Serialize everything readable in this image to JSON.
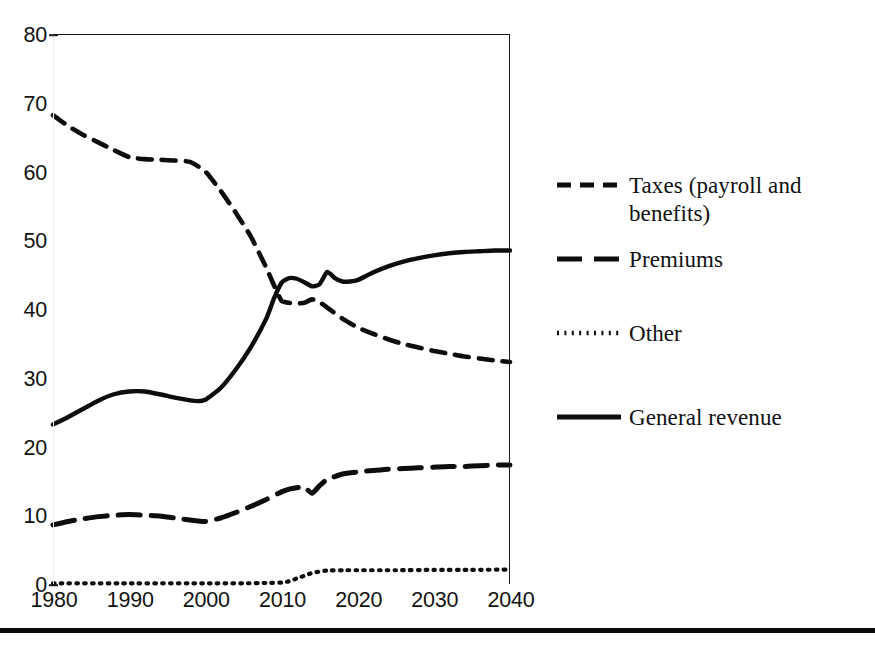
{
  "chart_data": {
    "type": "line",
    "title": "",
    "subtitle": "",
    "xlabel": "",
    "ylabel": "",
    "xlim": [
      1980,
      2040
    ],
    "ylim": [
      0,
      80
    ],
    "ytick_labels": [
      "0",
      "10",
      "20",
      "30",
      "40",
      "50",
      "60",
      "70",
      "80"
    ],
    "ytick_values": [
      0,
      10,
      20,
      30,
      40,
      50,
      60,
      70,
      80
    ],
    "xtick_labels": [
      "1980",
      "1990",
      "2000",
      "2010",
      "2020",
      "2030",
      "2040"
    ],
    "xtick_values": [
      1980,
      1990,
      2000,
      2010,
      2020,
      2030,
      2040
    ],
    "grid": false,
    "legend_position": "right",
    "series": [
      {
        "name": "Taxes (payroll and benefits)",
        "style": "dashed",
        "color": "#0d0d0d",
        "x": [
          1980,
          1982,
          1984,
          1986,
          1988,
          1990,
          1992,
          1994,
          1996,
          1998,
          2000,
          2002,
          2004,
          2006,
          2008,
          2009,
          2010,
          2011,
          2012,
          2013,
          2014,
          2015,
          2016,
          2018,
          2020,
          2022,
          2024,
          2026,
          2028,
          2030,
          2032,
          2034,
          2036,
          2038,
          2040
        ],
        "values": [
          68.2,
          66.6,
          65.3,
          64.2,
          63.1,
          62.1,
          61.8,
          61.7,
          61.6,
          61.4,
          60.0,
          57.2,
          54.0,
          50.5,
          46.0,
          43.5,
          41.2,
          40.9,
          40.8,
          40.9,
          41.4,
          41.0,
          40.2,
          38.6,
          37.3,
          36.4,
          35.6,
          34.9,
          34.4,
          33.9,
          33.5,
          33.1,
          32.8,
          32.5,
          32.3
        ]
      },
      {
        "name": "Premiums",
        "style": "long-dashed",
        "color": "#0d0d0d",
        "x": [
          1980,
          1982,
          1984,
          1986,
          1988,
          1990,
          1992,
          1994,
          1996,
          1998,
          2000,
          2002,
          2004,
          2006,
          2008,
          2010,
          2011,
          2012,
          2013,
          2014,
          2015,
          2016,
          2018,
          2020,
          2022,
          2024,
          2026,
          2028,
          2030,
          2032,
          2034,
          2036,
          2038,
          2040
        ],
        "values": [
          8.6,
          9.1,
          9.5,
          9.8,
          10.0,
          10.1,
          10.0,
          9.9,
          9.6,
          9.3,
          9.1,
          9.6,
          10.4,
          11.3,
          12.3,
          13.4,
          13.8,
          14.0,
          14.1,
          13.2,
          14.3,
          15.2,
          16.0,
          16.3,
          16.5,
          16.7,
          16.8,
          16.9,
          17.0,
          17.1,
          17.1,
          17.2,
          17.3,
          17.3
        ]
      },
      {
        "name": "Other",
        "style": "dotted",
        "color": "#0d0d0d",
        "x": [
          1980,
          1990,
          2000,
          2005,
          2008,
          2010,
          2011,
          2012,
          2013,
          2014,
          2015,
          2016,
          2018,
          2020,
          2025,
          2030,
          2035,
          2040
        ],
        "values": [
          0.1,
          0.1,
          0.1,
          0.1,
          0.15,
          0.2,
          0.4,
          0.8,
          1.2,
          1.6,
          1.8,
          1.95,
          2.0,
          2.0,
          2.0,
          2.05,
          2.05,
          2.1
        ]
      },
      {
        "name": "General revenue",
        "style": "solid",
        "color": "#0d0d0d",
        "x": [
          1980,
          1982,
          1984,
          1986,
          1988,
          1990,
          1992,
          1994,
          1996,
          1998,
          1999,
          2000,
          2002,
          2004,
          2006,
          2008,
          2009,
          2010,
          2011,
          2012,
          2013,
          2014,
          2015,
          2016,
          2017,
          2018,
          2019,
          2020,
          2022,
          2024,
          2026,
          2028,
          2030,
          2032,
          2034,
          2036,
          2038,
          2040
        ],
        "values": [
          23.2,
          24.3,
          25.5,
          26.7,
          27.6,
          28.0,
          28.0,
          27.6,
          27.1,
          26.7,
          26.6,
          26.8,
          28.5,
          31.2,
          34.5,
          38.6,
          41.5,
          43.8,
          44.5,
          44.4,
          43.9,
          43.3,
          43.6,
          45.4,
          44.5,
          44.0,
          44.0,
          44.2,
          45.3,
          46.2,
          46.9,
          47.4,
          47.8,
          48.1,
          48.3,
          48.4,
          48.5,
          48.5
        ]
      }
    ],
    "annotations": []
  },
  "legend": {
    "items": [
      {
        "label": "Taxes (payroll and\nbenefits)",
        "icon": "short-dash-line-icon",
        "style": "dashed"
      },
      {
        "label": "Premiums",
        "icon": "long-dash-line-icon",
        "style": "long-dashed"
      },
      {
        "label": "Other",
        "icon": "dotted-line-icon",
        "style": "dotted"
      },
      {
        "label": "General revenue",
        "icon": "solid-line-icon",
        "style": "solid"
      }
    ]
  },
  "colors": {
    "ink": "#0d0d0d",
    "axis": "#1a1a1a",
    "background": "#ffffff",
    "rule": "#0a0a0a"
  }
}
